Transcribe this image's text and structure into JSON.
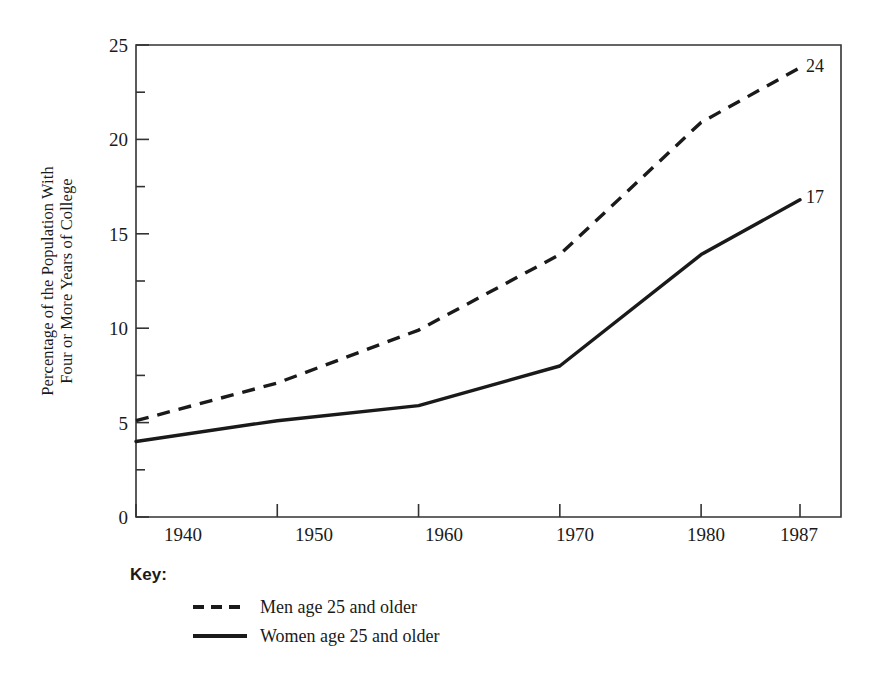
{
  "chart_data": {
    "type": "line",
    "title": "",
    "xlabel": "",
    "ylabel": "Percentage of the Population With Four or More Years of College",
    "ylabel_lines": [
      "Percentage of the Population With",
      "Four or More Years of College"
    ],
    "x": [
      1940,
      1950,
      1960,
      1970,
      1980,
      1987
    ],
    "xtick_labels": [
      "1940",
      "1950",
      "1960",
      "1970",
      "1980",
      "1987"
    ],
    "ytick_labels": [
      "0",
      "5",
      "10",
      "15",
      "20",
      "25"
    ],
    "ytick_values": [
      0,
      5,
      10,
      15,
      20,
      25
    ],
    "minor_tick_step": 2.5,
    "xlim": [
      1940,
      1987
    ],
    "ylim": [
      0,
      25
    ],
    "grid": false,
    "legend_position": "below-axes-left",
    "series": [
      {
        "name": "Men age 25 and older",
        "style": "dashed",
        "color": "#1a1a1a",
        "values": [
          5.1,
          7.1,
          9.9,
          13.9,
          20.9,
          23.8
        ],
        "end_label": "24"
      },
      {
        "name": "Women age 25 and older",
        "style": "solid",
        "color": "#1a1a1a",
        "values": [
          4.0,
          5.1,
          5.9,
          8.0,
          13.9,
          16.8
        ],
        "end_label": "17"
      }
    ],
    "annotations": [
      {
        "text": "24",
        "x": 1987,
        "y": 23.8
      },
      {
        "text": "17",
        "x": 1987,
        "y": 16.8
      }
    ]
  },
  "legend": {
    "title": "Key:",
    "entries": [
      {
        "label": "Men age 25 and older",
        "style": "dashed"
      },
      {
        "label": "Women age 25 and older",
        "style": "solid"
      }
    ]
  }
}
